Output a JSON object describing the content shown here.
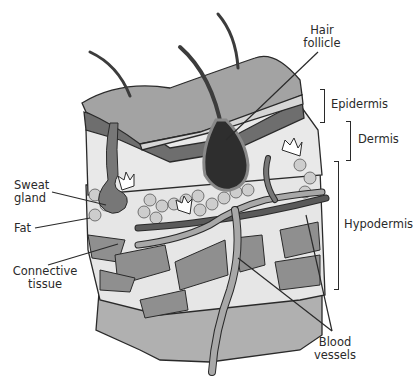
{
  "diagram": {
    "type": "anatomical cross-section",
    "colors": {
      "epidermis_top": "#a3a3a3",
      "hair": "#3c3c3c",
      "follicle_bulb": "#2e2e2e",
      "fat_cells": "#cdcdcd",
      "connective_tissue": "#8a8a8a",
      "blood_vessel_light": "#a8a8a8",
      "blood_vessel_dark": "#5a5a5a",
      "outline": "#2a2a2a",
      "background": "#ffffff"
    }
  },
  "labels": {
    "hair_follicle": [
      "Hair",
      "follicle"
    ],
    "epidermis": "Epidermis",
    "dermis": "Dermis",
    "hypodermis": "Hypodermis",
    "sweat_gland": [
      "Sweat",
      "gland"
    ],
    "fat": "Fat",
    "connective_tissue": [
      "Connective",
      "tissue"
    ],
    "blood_vessels": [
      "Blood",
      "vessels"
    ]
  }
}
